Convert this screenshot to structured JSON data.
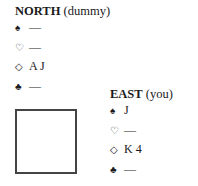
{
  "north": {
    "name": "NORTH",
    "role": "(dummy)",
    "suits": [
      {
        "suit": "spades",
        "symbol": "♠",
        "cards": "—"
      },
      {
        "suit": "hearts",
        "symbol": "♡",
        "cards": "—"
      },
      {
        "suit": "diamonds",
        "symbol": "◇",
        "cards": "A J"
      },
      {
        "suit": "clubs",
        "symbol": "♣",
        "cards": "—"
      }
    ]
  },
  "east": {
    "name": "EAST",
    "role": "(you)",
    "suits": [
      {
        "suit": "spades",
        "symbol": "♠",
        "cards": "J"
      },
      {
        "suit": "hearts",
        "symbol": "♡",
        "cards": "—"
      },
      {
        "suit": "diamonds",
        "symbol": "◇",
        "cards": "K 4"
      },
      {
        "suit": "clubs",
        "symbol": "♣",
        "cards": "—"
      }
    ]
  }
}
